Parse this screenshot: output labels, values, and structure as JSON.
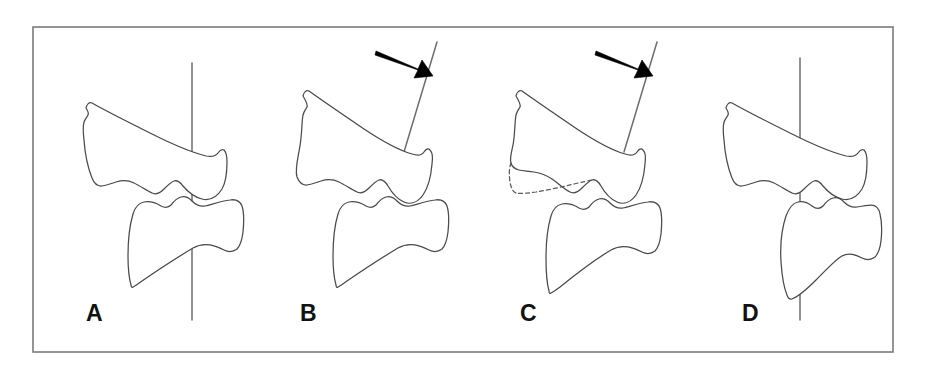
{
  "figure": {
    "kind": "line-drawing",
    "background_color": "#ffffff",
    "frame": {
      "name": "figure-border",
      "x": 33,
      "y": 27,
      "width": 860,
      "height": 325,
      "stroke_color": "#7b7b7b",
      "stroke_width": 1.6,
      "fill": "#ffffff"
    },
    "stroke_colors": {
      "outline": "#4a4a4a",
      "reference_line": "#6d6d6d",
      "dashed_outline": "#5a5a5a",
      "arrow": "#000000",
      "label": "#121212"
    },
    "panels": [
      {
        "id": "A",
        "label": "A",
        "label_x": 86,
        "label_y": 321,
        "description": "normal alignment, vertical reference line",
        "has_arrow": false,
        "has_dashed_outline": false,
        "reference_line": {
          "type": "vertical",
          "x1": 192,
          "y1": 63,
          "x2": 192,
          "y2": 320
        }
      },
      {
        "id": "B",
        "label": "B",
        "label_x": 300,
        "label_y": 321,
        "description": "angulated reference line with arrow",
        "has_arrow": true,
        "has_dashed_outline": false,
        "reference_line": {
          "type": "tilted",
          "x1": 437,
          "y1": 42,
          "x2": 404,
          "y2": 152
        },
        "arrow": {
          "tail_x": 376,
          "tail_y": 52,
          "tip_x": 429,
          "tip_y": 75
        }
      },
      {
        "id": "C",
        "label": "C",
        "label_x": 520,
        "label_y": 321,
        "description": "angulated reference line with arrow and dashed original vertebral outline",
        "has_arrow": true,
        "has_dashed_outline": true,
        "reference_line": {
          "type": "tilted",
          "x1": 657,
          "y1": 42,
          "x2": 624,
          "y2": 152
        },
        "arrow": {
          "tail_x": 596,
          "tail_y": 52,
          "tip_x": 649,
          "tip_y": 75
        }
      },
      {
        "id": "D",
        "label": "D",
        "label_x": 742,
        "label_y": 321,
        "description": "vertical reference line with displaced lower vertebra",
        "has_arrow": false,
        "has_dashed_outline": false,
        "reference_line": {
          "type": "vertical",
          "x1": 800,
          "y1": 58,
          "x2": 800,
          "y2": 320
        }
      }
    ],
    "elements": {
      "upper_vertebra_name": "upper-vertebral-body",
      "lower_vertebra_name": "lower-vertebral-body",
      "reference_line_name": "reference-line",
      "arrow_name": "arrow-icon",
      "dashed_name": "dashed-original-outline"
    }
  }
}
